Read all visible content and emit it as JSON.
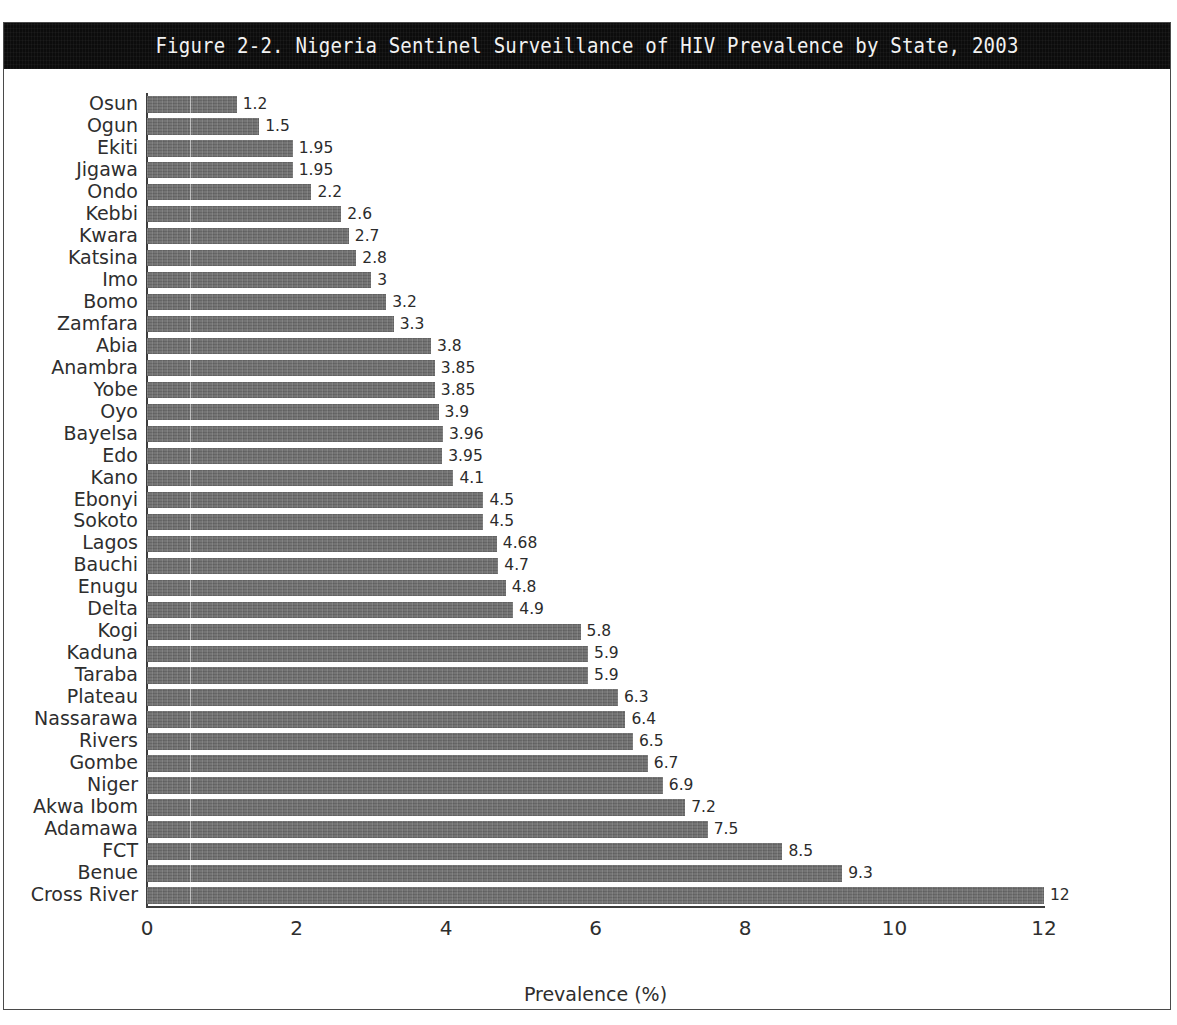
{
  "figure": {
    "title": "Figure 2-2. Nigeria Sentinel Surveillance of HIV Prevalence by State, 2003"
  },
  "chart_data": {
    "type": "bar",
    "orientation": "horizontal",
    "title": "Figure 2-2. Nigeria Sentinel Surveillance of HIV Prevalence by State, 2003",
    "xlabel": "Prevalence (%)",
    "ylabel": "",
    "xlim": [
      0,
      12
    ],
    "xticks": [
      "0",
      "2",
      "4",
      "6",
      "8",
      "10",
      "12"
    ],
    "xtick_values": [
      0,
      2,
      4,
      6,
      8,
      10,
      12
    ],
    "grid": false,
    "legend": "none",
    "bar_color": "#6e6e6e",
    "categories": [
      "Osun",
      "Ogun",
      "Ekiti",
      "Jigawa",
      "Ondo",
      "Kebbi",
      "Kwara",
      "Katsina",
      "Imo",
      "Bomo",
      "Zamfara",
      "Abia",
      "Anambra",
      "Yobe",
      "Oyo",
      "Bayelsa",
      "Edo",
      "Kano",
      "Ebonyi",
      "Sokoto",
      "Lagos",
      "Bauchi",
      "Enugu",
      "Delta",
      "Kogi",
      "Kaduna",
      "Taraba",
      "Plateau",
      "Nassarawa",
      "Rivers",
      "Gombe",
      "Niger",
      "Akwa Ibom",
      "Adamawa",
      "FCT",
      "Benue",
      "Cross River"
    ],
    "values": [
      1.2,
      1.5,
      1.95,
      1.95,
      2.2,
      2.6,
      2.7,
      2.8,
      3,
      3.2,
      3.3,
      3.8,
      3.85,
      3.85,
      3.9,
      3.96,
      3.95,
      4.1,
      4.5,
      4.5,
      4.68,
      4.7,
      4.8,
      4.9,
      5.8,
      5.9,
      5.9,
      6.3,
      6.4,
      6.5,
      6.7,
      6.9,
      7.2,
      7.5,
      8.5,
      9.3,
      12
    ],
    "value_labels": [
      "1.2",
      "1.5",
      "1.95",
      "1.95",
      "2.2",
      "2.6",
      "2.7",
      "2.8",
      "3",
      "3.2",
      "3.3",
      "3.8",
      "3.85",
      "3.85",
      "3.9",
      "3.96",
      "3.95",
      "4.1",
      "4.5",
      "4.5",
      "4.68",
      "4.7",
      "4.8",
      "4.9",
      "5.8",
      "5.9",
      "5.9",
      "6.3",
      "6.4",
      "6.5",
      "6.7",
      "6.9",
      "7.2",
      "7.5",
      "8.5",
      "9.3",
      "12"
    ]
  }
}
